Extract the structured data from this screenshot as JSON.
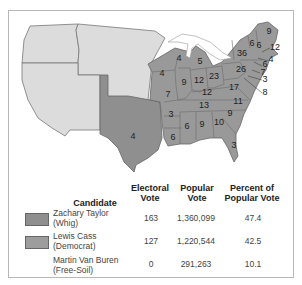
{
  "map": {
    "title": "Election of 1848",
    "colors": {
      "whig": "#8f8f8f",
      "democrat": "#9a9a9a",
      "territory": "#dcdcdc",
      "water": "#ffffff",
      "border": "#666666"
    },
    "state_labels": [
      {
        "value": "9",
        "x": 269,
        "y": 34
      },
      {
        "value": "6",
        "x": 252,
        "y": 46
      },
      {
        "value": "6",
        "x": 259,
        "y": 48
      },
      {
        "value": "12",
        "x": 275,
        "y": 50
      },
      {
        "value": "36",
        "x": 242,
        "y": 56
      },
      {
        "value": "4",
        "x": 271,
        "y": 62
      },
      {
        "value": "6",
        "x": 265,
        "y": 67
      },
      {
        "value": "26",
        "x": 241,
        "y": 72
      },
      {
        "value": "7",
        "x": 263,
        "y": 75
      },
      {
        "value": "3",
        "x": 265,
        "y": 82
      },
      {
        "value": "8",
        "x": 265,
        "y": 95
      },
      {
        "value": "4",
        "x": 179,
        "y": 61
      },
      {
        "value": "5",
        "x": 200,
        "y": 64
      },
      {
        "value": "4",
        "x": 162,
        "y": 76
      },
      {
        "value": "9",
        "x": 184,
        "y": 85
      },
      {
        "value": "12",
        "x": 199,
        "y": 83
      },
      {
        "value": "23",
        "x": 214,
        "y": 79
      },
      {
        "value": "17",
        "x": 234,
        "y": 90
      },
      {
        "value": "7",
        "x": 168,
        "y": 97
      },
      {
        "value": "12",
        "x": 207,
        "y": 95
      },
      {
        "value": "11",
        "x": 238,
        "y": 104
      },
      {
        "value": "13",
        "x": 204,
        "y": 108
      },
      {
        "value": "3",
        "x": 171,
        "y": 117
      },
      {
        "value": "9",
        "x": 230,
        "y": 116
      },
      {
        "value": "6",
        "x": 187,
        "y": 129
      },
      {
        "value": "9",
        "x": 202,
        "y": 127
      },
      {
        "value": "10",
        "x": 219,
        "y": 125
      },
      {
        "value": "4",
        "x": 133,
        "y": 139
      },
      {
        "value": "6",
        "x": 173,
        "y": 140
      },
      {
        "value": "3",
        "x": 234,
        "y": 148
      }
    ]
  },
  "table": {
    "headers": {
      "candidate": "Candidate",
      "electoral_line1": "Electoral",
      "electoral_line2": "Vote",
      "popular_line1": "Popular",
      "popular_line2": "Vote",
      "percent_line1": "Percent of",
      "percent_line2": "Popular Vote"
    },
    "rows": [
      {
        "name": "Zachary Taylor",
        "party": "(Whig)",
        "electoral": "163",
        "popular": "1,360,099",
        "percent": "47.4",
        "swatch": "#8f8f8f"
      },
      {
        "name": "Lewis Cass",
        "party": "(Democrat)",
        "electoral": "127",
        "popular": "1,220,544",
        "percent": "42.5",
        "swatch": "#9d9d9d"
      },
      {
        "name": "Martin Van Buren",
        "party": "(Free-Soil)",
        "electoral": "0",
        "popular": "291,263",
        "percent": "10.1",
        "swatch": ""
      }
    ]
  }
}
